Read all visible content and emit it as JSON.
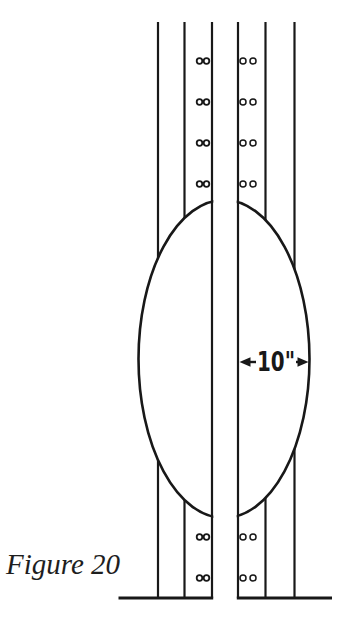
{
  "figure": {
    "caption": "Figure 20",
    "dimension": {
      "label": "10\""
    },
    "colors": {
      "ink": "#181818",
      "background": "#ffffff"
    }
  }
}
